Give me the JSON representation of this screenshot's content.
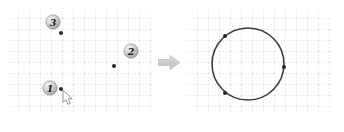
{
  "figure": {
    "before": {
      "points": [
        {
          "label": "1",
          "dot_x": 53,
          "dot_y": 81,
          "badge_x": 42,
          "badge_y": 80
        },
        {
          "label": "2",
          "dot_x": 106,
          "dot_y": 58,
          "badge_x": 123,
          "badge_y": 43
        },
        {
          "label": "3",
          "dot_x": 53,
          "dot_y": 25,
          "badge_x": 45,
          "badge_y": 14
        }
      ],
      "cursor": {
        "transform": "translate(55,82)"
      }
    },
    "after": {
      "circle": {
        "cx": 61,
        "cy": 56,
        "r": 36
      },
      "points": [
        {
          "x": 38,
          "y": 28
        },
        {
          "x": 97,
          "y": 59
        },
        {
          "x": 38,
          "y": 85
        }
      ]
    },
    "colors": {
      "grid": "#e1e1e1",
      "dot": "#262626",
      "circle_stroke": "#3d3d3d",
      "badge_text": "#1b1b1b",
      "arrow_fill_light": "#dddddd",
      "arrow_fill_dark": "#bfbfbf",
      "arrow_stroke": "#b3b3b3",
      "cursor_fill": "#ffffff",
      "cursor_stroke": "#8f8f8f"
    }
  }
}
